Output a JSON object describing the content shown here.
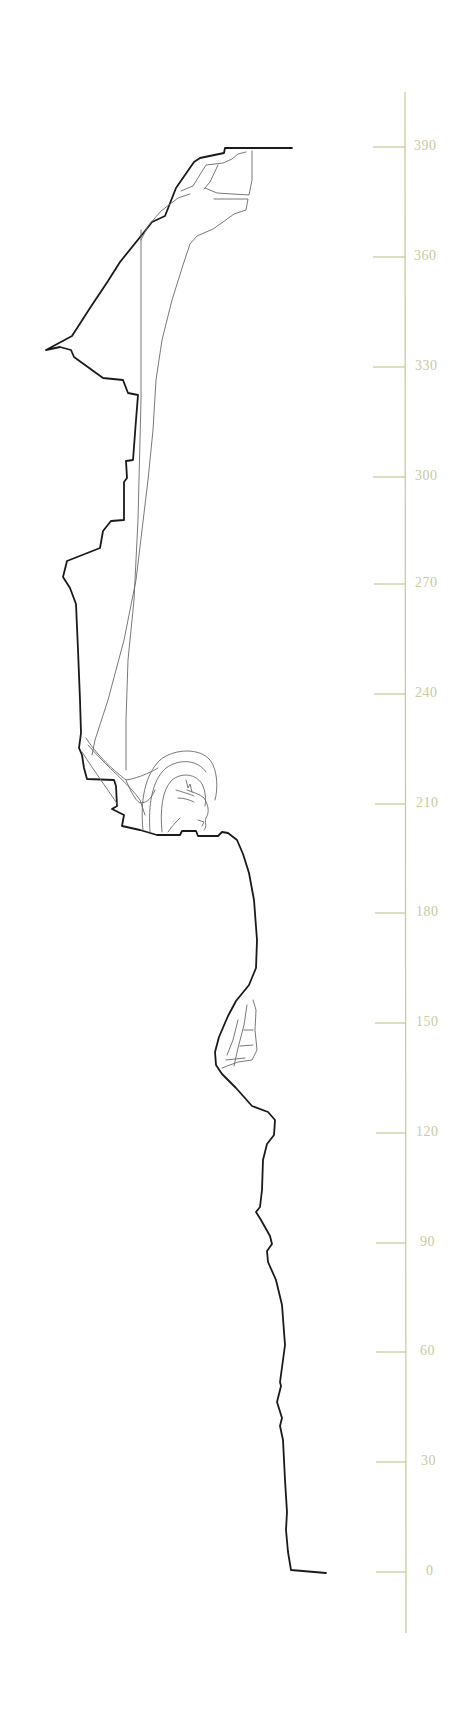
{
  "figure": {
    "type": "profile-elevation",
    "colors": {
      "profile_stroke": "#1a1a1a",
      "detail_stroke": "#6a6a6a",
      "scale_color": "#c9cc9a",
      "label_color": "#c8caa0",
      "background": "#ffffff"
    }
  },
  "scale": {
    "orientation": "vertical",
    "unit_step": 30,
    "min": 0,
    "max": 390,
    "ticks": [
      {
        "value": 390,
        "label": "390"
      },
      {
        "value": 360,
        "label": "360"
      },
      {
        "value": 330,
        "label": "330"
      },
      {
        "value": 300,
        "label": "300"
      },
      {
        "value": 270,
        "label": "270"
      },
      {
        "value": 240,
        "label": "240"
      },
      {
        "value": 210,
        "label": "210"
      },
      {
        "value": 180,
        "label": "180"
      },
      {
        "value": 150,
        "label": "150"
      },
      {
        "value": 120,
        "label": "120"
      },
      {
        "value": 90,
        "label": "90"
      },
      {
        "value": 60,
        "label": "60"
      },
      {
        "value": 30,
        "label": "30"
      },
      {
        "value": 0,
        "label": "0"
      }
    ]
  }
}
